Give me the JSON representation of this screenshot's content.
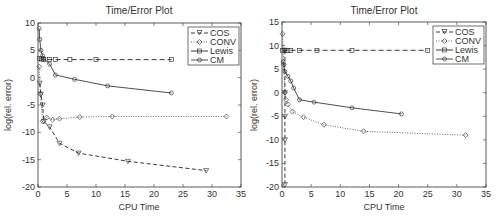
{
  "chart_data": [
    {
      "type": "line",
      "title": "Time/Error Plot",
      "xlabel": "CPU Time",
      "ylabel": "log(rel. error)",
      "xlim": [
        0,
        35
      ],
      "ylim": [
        -20,
        10
      ],
      "xticks": [
        0,
        5,
        10,
        15,
        20,
        25,
        30,
        35
      ],
      "yticks": [
        -20,
        -15,
        -10,
        -5,
        0,
        5,
        10
      ],
      "grid": false,
      "legend_position": "upper right",
      "series": [
        {
          "name": "COS",
          "style": "dashed",
          "marker": "triangle-down",
          "x": [
            0.3,
            0.5,
            0.8,
            1.0,
            2.0,
            3.7,
            7.0,
            15.5,
            29.0
          ],
          "y": [
            -1,
            -3,
            -5,
            -8,
            -9,
            -12,
            -13.8,
            -15.3,
            -17
          ]
        },
        {
          "name": "CONV",
          "style": "dotted",
          "marker": "diamond",
          "x": [
            0.2,
            0.4,
            0.8,
            1.5,
            2.5,
            3.7,
            7.2,
            12.8,
            32.5
          ],
          "y": [
            2,
            -3,
            -8,
            -7.3,
            -7.7,
            -7.5,
            -7.2,
            -7.1,
            -7.1
          ]
        },
        {
          "name": "Lewis",
          "style": "dashed",
          "marker": "square",
          "x": [
            0.3,
            0.6,
            1.0,
            2.0,
            3.0,
            5.5,
            10.0,
            23.0
          ],
          "y": [
            3.5,
            3.4,
            3.3,
            3.3,
            3.3,
            3.3,
            3.3,
            3.3
          ]
        },
        {
          "name": "CM",
          "style": "solid",
          "marker": "circle",
          "x": [
            0.2,
            0.3,
            0.5,
            0.8,
            1.0,
            2.0,
            3.0,
            6.3,
            12.0,
            23.0
          ],
          "y": [
            9,
            7,
            5,
            4,
            3.5,
            2.5,
            0.5,
            -0.3,
            -1.5,
            -2.8
          ]
        }
      ]
    },
    {
      "type": "line",
      "title": "Time/Error Plot",
      "xlabel": "CPU Time",
      "ylabel": "log(rel. error)",
      "xlim": [
        0,
        35
      ],
      "ylim": [
        -20,
        15
      ],
      "xticks": [
        0,
        5,
        10,
        15,
        20,
        25,
        30,
        35
      ],
      "yticks": [
        -20,
        -15,
        -10,
        -5,
        0,
        5,
        10,
        15
      ],
      "grid": false,
      "legend_position": "upper right",
      "series": [
        {
          "name": "COS",
          "style": "dashed",
          "marker": "triangle-down",
          "x": [
            0.5,
            0.5,
            0.5,
            0.5,
            0.5
          ],
          "y": [
            9,
            0,
            -5,
            -10,
            -19.5
          ]
        },
        {
          "name": "CONV",
          "style": "dotted",
          "marker": "diamond",
          "x": [
            0.1,
            0.3,
            0.5,
            0.7,
            1.0,
            1.8,
            3.7,
            7.2,
            14.0,
            31.5
          ],
          "y": [
            12.5,
            6,
            0,
            -1.5,
            -2.5,
            -4,
            -5.2,
            -6.8,
            -8.2,
            -9
          ]
        },
        {
          "name": "Lewis",
          "style": "dashed",
          "marker": "square",
          "x": [
            0.1,
            0.5,
            1.0,
            1.5,
            3.0,
            6.0,
            12.0,
            25.0
          ],
          "y": [
            9,
            9,
            9,
            9,
            9,
            9,
            9,
            9
          ]
        },
        {
          "name": "CM",
          "style": "solid",
          "marker": "circle",
          "x": [
            0.2,
            0.5,
            1.0,
            1.5,
            2.0,
            3.0,
            5.5,
            12.0,
            20.5
          ],
          "y": [
            6.5,
            4.5,
            3.5,
            2.5,
            1,
            -1.5,
            -2,
            -3.2,
            -4.5
          ]
        }
      ]
    }
  ],
  "plots": [
    {
      "title": "Time/Error Plot",
      "xlabel": "CPU Time",
      "ylabel": "log(rel. error)",
      "legend": [
        "COS",
        "CONV",
        "Lewis",
        "CM"
      ]
    },
    {
      "title": "Time/Error Plot",
      "xlabel": "CPU Time",
      "ylabel": "log(rel. error)",
      "legend": [
        "COS",
        "CONV",
        "Lewis",
        "CM"
      ]
    }
  ]
}
